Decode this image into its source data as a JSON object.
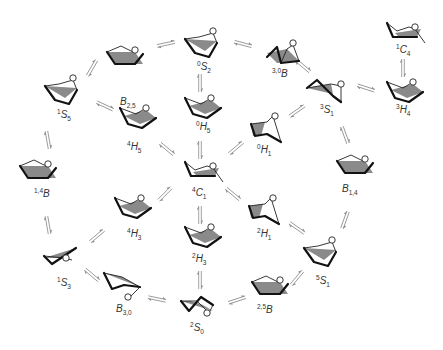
{
  "diagram": {
    "colors": {
      "background": "#ffffff",
      "bond": "#111111",
      "plane": "#8a8a8a",
      "arrow": "#8c8c8c",
      "label": "#333333"
    },
    "conformers": [
      {
        "id": "B25",
        "letter": "B",
        "sup": "",
        "sub": "2,5",
        "x": 125,
        "y": 58,
        "lx": 120,
        "ly": 105,
        "shape": "boat"
      },
      {
        "id": "0S2",
        "letter": "S",
        "sup": "0",
        "sub": "2",
        "x": 203,
        "y": 45,
        "lx": 197,
        "ly": 70,
        "shape": "skew"
      },
      {
        "id": "30B",
        "letter": "B",
        "sup": "3,0",
        "sub": "",
        "x": 283,
        "y": 55,
        "lx": 272,
        "ly": 77,
        "shape": "boatl"
      },
      {
        "id": "1C4",
        "letter": "C",
        "sup": "1",
        "sub": "4",
        "x": 405,
        "y": 33,
        "lx": 396,
        "ly": 53,
        "shape": "chair"
      },
      {
        "id": "1S5",
        "letter": "S",
        "sup": "1",
        "sub": "5",
        "x": 63,
        "y": 92,
        "lx": 57,
        "ly": 118,
        "shape": "skew"
      },
      {
        "id": "3S1",
        "letter": "S",
        "sup": "3",
        "sub": "1",
        "x": 325,
        "y": 88,
        "lx": 320,
        "ly": 113,
        "shape": "skewl"
      },
      {
        "id": "3H4",
        "letter": "H",
        "sup": "3",
        "sub": "4",
        "x": 405,
        "y": 92,
        "lx": 396,
        "ly": 113,
        "shape": "half"
      },
      {
        "id": "0H5",
        "letter": "H",
        "sup": "0",
        "sub": "5",
        "x": 203,
        "y": 108,
        "lx": 196,
        "ly": 130,
        "shape": "half"
      },
      {
        "id": "4H5",
        "letter": "H",
        "sup": "4",
        "sub": "5",
        "x": 138,
        "y": 118,
        "lx": 127,
        "ly": 150,
        "shape": "half"
      },
      {
        "id": "0H1",
        "letter": "H",
        "sup": "0",
        "sub": "1",
        "x": 267,
        "y": 128,
        "lx": 257,
        "ly": 153,
        "shape": "halfl"
      },
      {
        "id": "14B",
        "letter": "B",
        "sup": "1,4",
        "sub": "",
        "x": 38,
        "y": 172,
        "lx": 34,
        "ly": 197,
        "shape": "boat"
      },
      {
        "id": "4C1",
        "letter": "C",
        "sup": "4",
        "sub": "1",
        "x": 203,
        "y": 172,
        "lx": 192,
        "ly": 196,
        "shape": "chair"
      },
      {
        "id": "B14",
        "letter": "B",
        "sup": "",
        "sub": "1,4",
        "x": 355,
        "y": 167,
        "lx": 342,
        "ly": 192,
        "shape": "boat"
      },
      {
        "id": "4H3",
        "letter": "H",
        "sup": "4",
        "sub": "3",
        "x": 133,
        "y": 208,
        "lx": 127,
        "ly": 237,
        "shape": "half"
      },
      {
        "id": "2H1",
        "letter": "H",
        "sup": "2",
        "sub": "1",
        "x": 265,
        "y": 210,
        "lx": 257,
        "ly": 237,
        "shape": "halfl"
      },
      {
        "id": "2H3",
        "letter": "H",
        "sup": "2",
        "sub": "3",
        "x": 203,
        "y": 237,
        "lx": 192,
        "ly": 262,
        "shape": "half"
      },
      {
        "id": "1S3",
        "letter": "S",
        "sup": "1",
        "sub": "3",
        "x": 60,
        "y": 260,
        "lx": 57,
        "ly": 286,
        "shape": "skewflat"
      },
      {
        "id": "5S1",
        "letter": "S",
        "sup": "5",
        "sub": "1",
        "x": 322,
        "y": 254,
        "lx": 316,
        "ly": 284,
        "shape": "skew"
      },
      {
        "id": "B30",
        "letter": "B",
        "sup": "",
        "sub": "3,0",
        "x": 122,
        "y": 285,
        "lx": 116,
        "ly": 312,
        "shape": "boatO"
      },
      {
        "id": "2S0",
        "letter": "S",
        "sup": "2",
        "sub": "0",
        "x": 197,
        "y": 305,
        "lx": 190,
        "ly": 331,
        "shape": "skewO"
      },
      {
        "id": "25B",
        "letter": "B",
        "sup": "2,5",
        "sub": "",
        "x": 270,
        "y": 288,
        "lx": 257,
        "ly": 313,
        "shape": "boat"
      }
    ],
    "equilibria": [
      {
        "x": 92,
        "y": 68,
        "angle": -60
      },
      {
        "x": 166,
        "y": 44,
        "angle": -12
      },
      {
        "x": 243,
        "y": 44,
        "angle": 15
      },
      {
        "x": 303,
        "y": 66,
        "angle": 40
      },
      {
        "x": 366,
        "y": 88,
        "angle": 18
      },
      {
        "x": 403,
        "y": 68,
        "angle": 90
      },
      {
        "x": 105,
        "y": 106,
        "angle": 25
      },
      {
        "x": 200,
        "y": 83,
        "angle": 90
      },
      {
        "x": 200,
        "y": 150,
        "angle": 90
      },
      {
        "x": 167,
        "y": 149,
        "angle": 40
      },
      {
        "x": 236,
        "y": 148,
        "angle": -40
      },
      {
        "x": 297,
        "y": 111,
        "angle": -35
      },
      {
        "x": 345,
        "y": 135,
        "angle": 70
      },
      {
        "x": 48,
        "y": 140,
        "angle": 80
      },
      {
        "x": 48,
        "y": 225,
        "angle": 80
      },
      {
        "x": 165,
        "y": 194,
        "angle": -45
      },
      {
        "x": 233,
        "y": 194,
        "angle": 40
      },
      {
        "x": 200,
        "y": 215,
        "angle": 90
      },
      {
        "x": 345,
        "y": 220,
        "angle": -70
      },
      {
        "x": 297,
        "y": 228,
        "angle": 35
      },
      {
        "x": 97,
        "y": 236,
        "angle": -40
      },
      {
        "x": 92,
        "y": 275,
        "angle": 40
      },
      {
        "x": 157,
        "y": 299,
        "angle": 12
      },
      {
        "x": 200,
        "y": 280,
        "angle": 90
      },
      {
        "x": 237,
        "y": 300,
        "angle": -18
      },
      {
        "x": 297,
        "y": 278,
        "angle": -50
      }
    ]
  }
}
